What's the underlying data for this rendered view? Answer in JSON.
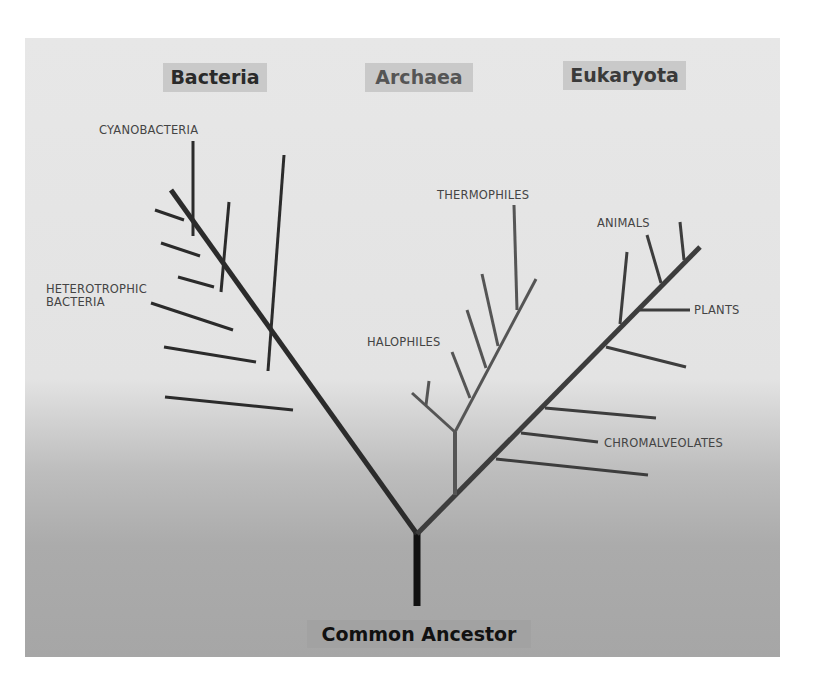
{
  "domains": {
    "bacteria": {
      "label": "Bacteria",
      "text_color": "#2a2a2a"
    },
    "archaea": {
      "label": "Archaea",
      "text_color": "#555555"
    },
    "eukaryota": {
      "label": "Eukaryota",
      "text_color": "#3a3a3a"
    }
  },
  "root": {
    "label": "Common Ancestor"
  },
  "groups": {
    "cyanobacteria": "CYANOBACTERIA",
    "heterotrophic_bacteria_line1": "HETEROTROPHIC",
    "heterotrophic_bacteria_line2": "BACTERIA",
    "thermophiles": "THERMOPHILES",
    "halophiles": "HALOPHILES",
    "animals": "ANIMALS",
    "plants": "PLANTS",
    "chromalveolates": "CHROMALVEOLATES"
  },
  "colors": {
    "bacteria_branch": "#2b2b2b",
    "archaea_branch": "#555555",
    "eukaryota_branch": "#3d3d3d",
    "trunk": "#111111",
    "label_box": "#c9c9c9"
  }
}
